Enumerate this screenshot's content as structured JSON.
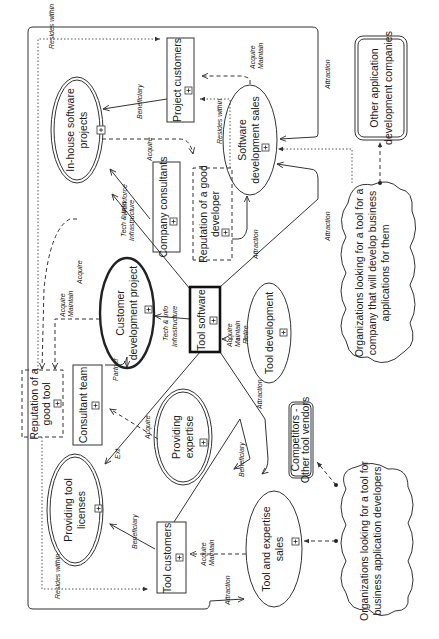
{
  "diagram": {
    "orientation": "rotated-90-ccw",
    "nodes": {
      "inhouse_projects": {
        "label_line1": "In-house software",
        "label_line2": "projects",
        "shape": "double-ellipse"
      },
      "project_customers": {
        "label": "Project customers",
        "shape": "box"
      },
      "company_consultants": {
        "label": "Company consultants",
        "shape": "box"
      },
      "reputation_developer": {
        "label_line1": "Reputation of a good",
        "label_line2": "developer",
        "shape": "dashed-box"
      },
      "software_dev_sales": {
        "label_line1": "Software",
        "label_line2": "development sales",
        "shape": "ellipse"
      },
      "other_app_dev": {
        "label_line1": "Other application",
        "label_line2": "development companies",
        "shape": "double-rounded-box"
      },
      "cloud_business_apps": {
        "label_line1": "Organizations looking for a tool for a",
        "label_line2": "company that will develop business",
        "label_line3": "applications for them",
        "shape": "cloud"
      },
      "customer_dev_project": {
        "label_line1": "Customer",
        "label_line2": "development project",
        "shape": "thick-ellipse"
      },
      "tool_software": {
        "label": "Tool software",
        "shape": "thick-box"
      },
      "tool_development": {
        "label": "Tool development",
        "shape": "ellipse"
      },
      "reputation_tool": {
        "label_line1": "Reputation of a",
        "label_line2": "good tool",
        "shape": "dashed-box"
      },
      "consultant_team": {
        "label": "Consultant team",
        "shape": "box"
      },
      "providing_expertise": {
        "label_line1": "Providing",
        "label_line2": "expertise",
        "shape": "double-ellipse"
      },
      "competitors": {
        "label_line1": "Competitors -",
        "label_line2": "Other tool vendors",
        "shape": "double-rounded-box"
      },
      "providing_licenses": {
        "label_line1": "Providing tool",
        "label_line2": "licenses",
        "shape": "double-ellipse"
      },
      "tool_customers": {
        "label": "Tool customers",
        "shape": "box"
      },
      "tool_expertise_sales": {
        "label_line1": "Tool and expertise",
        "label_line2": "sales",
        "shape": "ellipse"
      },
      "cloud_app_developers": {
        "label_line1": "Organizations looking for a tool for",
        "label_line2": "business application developers",
        "shape": "cloud"
      }
    },
    "edge_labels": {
      "resides_within_top": "Resides within",
      "beneficiary_top": "Beneficiary",
      "acquire_top": "Acquire",
      "workforce": "Workforce",
      "tech_info_top_1": "Tech & Info",
      "tech_info_top_2": "Infrastructure",
      "acquire_maintain_top_1": "Acquire",
      "acquire_maintain_top_2": "Maintain",
      "resides_within_dev": "Resides within",
      "attraction_top": "Attraction",
      "attraction_mid": "Attraction",
      "attraction_dev": "Attraction",
      "acquire_left": "Acquire",
      "acquire_maintain_left_1": "Acquire",
      "acquire_maintain_left_2": "Maintain",
      "tech_info_mid_1": "Tech & Info",
      "tech_info_mid_2": "Infrastructure",
      "acquire_maintain_retire_1": "Acquire",
      "acquire_maintain_retire_2": "Maintain",
      "acquire_maintain_retire_3": "Retire",
      "partner": "Partner",
      "acquire_consult": "Acquire",
      "ext": "Ext",
      "attraction_low": "Attraction",
      "beneficiary_expertise": "Beneficiary",
      "beneficiary_licenses": "Beneficiary",
      "resides_within_bottom": "Resides within",
      "acquire_maintain_bottom_1": "Acquire",
      "acquire_maintain_bottom_2": "Maintain",
      "attraction_bottom": "Attraction"
    },
    "expand_marker": "+"
  }
}
